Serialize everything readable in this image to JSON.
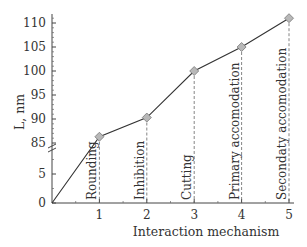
{
  "chart_data": {
    "type": "line",
    "title": "",
    "xlabel": "Interaction mechanism",
    "ylabel": "L, nm",
    "x": [
      0,
      1,
      2,
      3,
      4,
      5
    ],
    "x_ticks": [
      "1",
      "2",
      "3",
      "4",
      "5"
    ],
    "y_ticks_upper": [
      "85",
      "90",
      "95",
      "100",
      "105",
      "110"
    ],
    "y_ticks_lower": [
      "0",
      "5"
    ],
    "axis_break": "between 5 and 85",
    "series": [
      {
        "name": "L",
        "values": [
          0,
          86.3,
          90.3,
          100,
          105,
          111
        ],
        "marker": "diamond"
      }
    ],
    "annotations": [
      {
        "x": 1,
        "text": "Rounding"
      },
      {
        "x": 2,
        "text": "Inhibition"
      },
      {
        "x": 3,
        "text": "Cutting"
      },
      {
        "x": 4,
        "text": "Primary accomodation"
      },
      {
        "x": 5,
        "text": "Secondaty accomodation"
      }
    ],
    "ylim": [
      0,
      112
    ],
    "xlim": [
      0,
      5
    ],
    "grid": false,
    "legend": "none"
  },
  "colors": {
    "line": "#333333",
    "marker_fill": "#b8b8b8",
    "marker_stroke": "#777777",
    "dashed": "#666666"
  }
}
